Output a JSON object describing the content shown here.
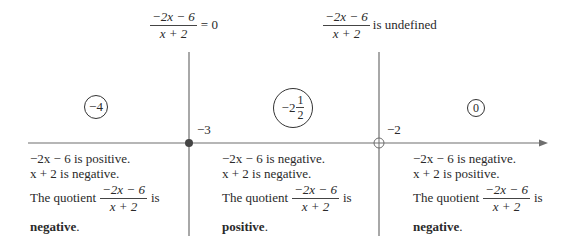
{
  "header_labels": {
    "zero": {
      "numerator": "−2x − 6",
      "denominator": "x + 2",
      "suffix": "= 0"
    },
    "undefined": {
      "numerator": "−2x − 6",
      "denominator": "x + 2",
      "suffix": "is undefined"
    }
  },
  "number_line": {
    "critical_points": [
      {
        "label": "−3",
        "marker": "closed-dot",
        "meaning": "numerator zero"
      },
      {
        "label": "−2",
        "marker": "open-dot",
        "meaning": "denominator zero"
      }
    ],
    "test_values": [
      {
        "label": "−4",
        "whole": "−4"
      },
      {
        "label": "−2 1/2",
        "whole": "−2",
        "frac_num": "1",
        "frac_den": "2"
      },
      {
        "label": "0",
        "whole": "0"
      }
    ]
  },
  "regions": [
    {
      "line1": "−2x − 6 is positive.",
      "line2": "x + 2 is negative.",
      "quotient_prefix": "The quotient",
      "quotient_num": "−2x − 6",
      "quotient_den": "x + 2",
      "quotient_suffix": "is",
      "result": "negative",
      "result_period": "."
    },
    {
      "line1": "−2x − 6 is negative.",
      "line2": "x + 2 is negative.",
      "quotient_prefix": "The quotient",
      "quotient_num": "−2x − 6",
      "quotient_den": "x + 2",
      "quotient_suffix": "is",
      "result": "positive",
      "result_period": "."
    },
    {
      "line1": "−2x − 6 is negative.",
      "line2": "x + 2 is positive.",
      "quotient_prefix": "The quotient",
      "quotient_num": "−2x − 6",
      "quotient_den": "x + 2",
      "quotient_suffix": "is",
      "result": "negative",
      "result_period": "."
    }
  ],
  "colors": {
    "line": "#6e6e6e",
    "text": "#2a2a2a",
    "dot": "#444444"
  }
}
